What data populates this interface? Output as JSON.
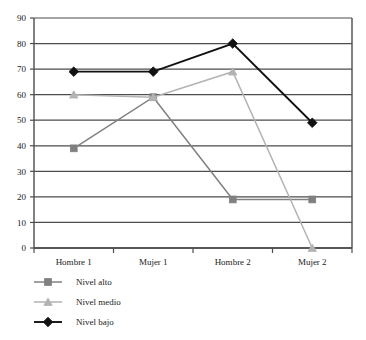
{
  "chart_data": {
    "type": "line",
    "title": "",
    "subtitle": "",
    "xlabel": "",
    "ylabel": "",
    "categories": [
      "Hombre 1",
      "Mujer 1",
      "Hombre 2",
      "Mujer 2"
    ],
    "ylim": [
      0,
      90
    ],
    "ytick_step": 10,
    "yticks": [
      "0",
      "10",
      "20",
      "30",
      "40",
      "50",
      "60",
      "70",
      "80",
      "90"
    ],
    "grid": true,
    "grid_axis": "y",
    "legend_position": "bottom-left",
    "series": [
      {
        "name": "Nivel alto",
        "values": [
          39,
          59,
          19,
          19
        ],
        "color": "#808080",
        "marker": "square"
      },
      {
        "name": "Nivel medio",
        "values": [
          60,
          59,
          69,
          0
        ],
        "color": "#b3b3b3",
        "marker": "triangle"
      },
      {
        "name": "Nivel bajo",
        "values": [
          69,
          69,
          80,
          49
        ],
        "color": "#111111",
        "marker": "diamond"
      }
    ]
  },
  "axis": {
    "y_labels": [
      "90",
      "80",
      "70",
      "60",
      "50",
      "40",
      "30",
      "20",
      "10",
      "0"
    ],
    "x_labels": [
      "Hombre 1",
      "Mujer 1",
      "Hombre 2",
      "Mujer 2"
    ]
  },
  "legend": {
    "items": [
      {
        "label": "Nivel alto",
        "color": "#808080",
        "marker": "square-marker"
      },
      {
        "label": "Nivel medio",
        "color": "#b3b3b3",
        "marker": "triangle-marker"
      },
      {
        "label": "Nivel bajo",
        "color": "#111111",
        "marker": "diamond-marker"
      }
    ]
  },
  "colors": {
    "axis": "#4d4d4d",
    "grid": "#4d4d4d",
    "background": "#ffffff",
    "text": "#1a1a1a"
  }
}
